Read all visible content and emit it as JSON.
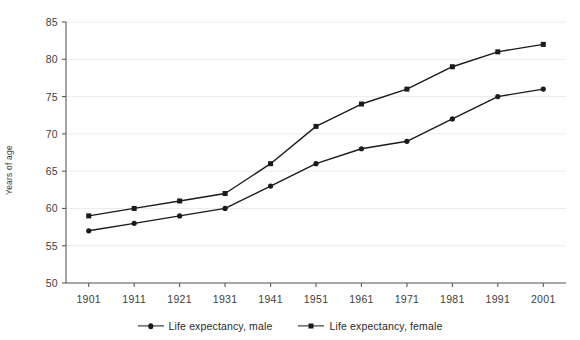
{
  "chart_data": {
    "type": "line",
    "title": "",
    "xlabel": "",
    "ylabel": "Years of age",
    "x": [
      1901,
      1911,
      1921,
      1931,
      1941,
      1951,
      1961,
      1971,
      1981,
      1991,
      2001
    ],
    "xtick_labels": [
      "1901",
      "1911",
      "1921",
      "1931",
      "1941",
      "1951",
      "1961",
      "1971",
      "1981",
      "1991",
      "2001"
    ],
    "ytick_labels": [
      "50",
      "55",
      "60",
      "65",
      "70",
      "75",
      "80",
      "85"
    ],
    "yticks": [
      50,
      55,
      60,
      65,
      70,
      75,
      80,
      85
    ],
    "ylim": [
      50,
      85
    ],
    "xlim": [
      1896,
      2006
    ],
    "grid": "horizontal",
    "legend_position": "bottom-center",
    "series": [
      {
        "name": "Life expectancy, male",
        "marker": "circle",
        "color": "#1a1a1a",
        "values": [
          57,
          58,
          59,
          60,
          63,
          66,
          68,
          69,
          72,
          75,
          76
        ]
      },
      {
        "name": "Life expectancy, female",
        "marker": "square",
        "color": "#1a1a1a",
        "values": [
          59,
          60,
          61,
          62,
          66,
          71,
          74,
          76,
          79,
          81,
          82
        ]
      }
    ]
  },
  "legend": {
    "items": [
      {
        "label": "Life expectancy, male",
        "marker": "circle"
      },
      {
        "label": "Life expectancy, female",
        "marker": "square"
      }
    ]
  },
  "colors": {
    "line": "#1a1a1a",
    "axis": "#5a5a5a",
    "grid": "#ececec",
    "text": "#404040",
    "background": "#ffffff"
  }
}
